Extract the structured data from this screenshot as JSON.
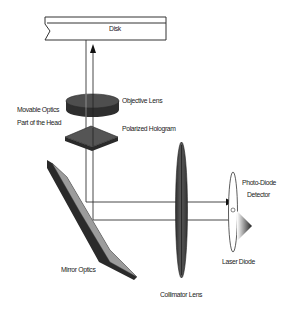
{
  "diagram": {
    "type": "optical-pickup-head-schematic",
    "colors": {
      "background": "#ffffff",
      "line": "#222222",
      "lens_dark": "#3a3a3a",
      "lens_mid": "#5a5a5a",
      "mirror_face": "#9a9a9a",
      "mirror_edge": "#2a2a2a"
    },
    "labels": {
      "disk": "Disk",
      "objective_lens": "Objective Lens",
      "movable_optics_line1": "Movable Optics",
      "movable_optics_line2": "Part of the Head",
      "polarized_hologram": "Polarized Hologram",
      "photo_diode_line1": "Photo-Diode",
      "photo_diode_line2": "Detector",
      "laser_diode": "Laser Diode",
      "mirror_optics": "Mirror Optics",
      "collimator_lens": "Collimator Lens"
    },
    "components": [
      {
        "id": "disk",
        "label": "Disk"
      },
      {
        "id": "objective-lens",
        "label": "Objective Lens"
      },
      {
        "id": "polarized-hologram",
        "label": "Polarized Hologram"
      },
      {
        "id": "mirror-optics",
        "label": "Mirror Optics"
      },
      {
        "id": "collimator-lens",
        "label": "Collimator Lens"
      },
      {
        "id": "photo-diode-detector",
        "label": "Photo-Diode Detector"
      },
      {
        "id": "laser-diode",
        "label": "Laser Diode"
      }
    ],
    "group_annotation": "Movable Optics Part of the Head"
  }
}
